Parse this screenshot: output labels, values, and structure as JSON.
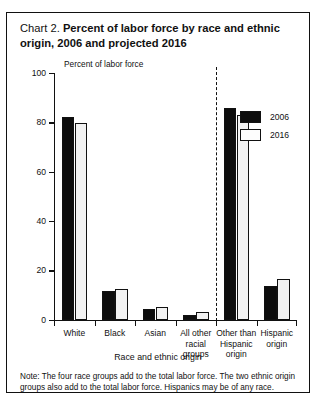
{
  "title": {
    "prefix": "Chart 2. ",
    "main": "Percent of labor force by race and ethnic origin, 2006 and projected 2016"
  },
  "note": "Note: The four race groups add to the total labor force. The two ethnic origin groups also add to the total labor force. Hispanics may be of any race.",
  "legend": {
    "items": [
      {
        "label": "2006",
        "color": "#0d0d0d"
      },
      {
        "label": "2016",
        "color": "#fdfdfd"
      }
    ]
  },
  "chart_data": {
    "type": "bar",
    "title": "Chart 2. Percent of labor force by race and ethnic origin, 2006 and projected 2016",
    "xlabel": "Race and ethnic origin",
    "ylabel": "Percent of labor force",
    "ylim": [
      0,
      100
    ],
    "yticks": [
      0,
      20,
      40,
      60,
      80,
      100
    ],
    "ytick_labels": [
      "0",
      "20",
      "40",
      "60",
      "80",
      "100"
    ],
    "grid": false,
    "legend_position": "upper right",
    "categories": [
      "White",
      "Black",
      "Asian",
      "All other\nracial\ngroups",
      "Other than\nHispanic\norigin",
      "Hispanic\norigin"
    ],
    "series": [
      {
        "name": "2006",
        "color": "#0d0d0d",
        "values": [
          82,
          11.5,
          4.4,
          2.0,
          86,
          13.7
        ]
      },
      {
        "name": "2016",
        "color": "#f2f2f2",
        "values": [
          79.6,
          12.3,
          5.3,
          3.0,
          83,
          16.4
        ]
      }
    ],
    "annotations": [
      {
        "type": "vertical-dashed-divider",
        "after_category_index": 3
      }
    ]
  }
}
